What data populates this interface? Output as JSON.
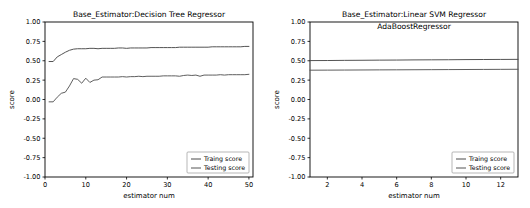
{
  "figure": {
    "background_color": "#ffffff",
    "width": 530,
    "height": 208
  },
  "chart_data": [
    {
      "id": "decision-tree",
      "type": "line",
      "title": "Base_Estimator:Decision Tree Regressor",
      "title_line2": "",
      "xlabel": "estimator num",
      "ylabel": "score",
      "xlim": [
        0,
        51
      ],
      "ylim": [
        -1.0,
        1.0
      ],
      "xticks": [
        0,
        10,
        20,
        30,
        40,
        50
      ],
      "xticklabels": [
        "0",
        "10",
        "20",
        "30",
        "40",
        "50"
      ],
      "yticks": [
        -1.0,
        -0.75,
        -0.5,
        -0.25,
        0.0,
        0.25,
        0.5,
        0.75,
        1.0
      ],
      "yticklabels": [
        "-1.00",
        "-0.75",
        "-0.50",
        "-0.25",
        "0.00",
        "0.25",
        "0.50",
        "0.75",
        "1.00"
      ],
      "grid": false,
      "legend_position": "lower right",
      "x": [
        1,
        2,
        3,
        4,
        5,
        6,
        7,
        8,
        9,
        10,
        11,
        12,
        13,
        14,
        15,
        16,
        17,
        18,
        19,
        20,
        21,
        22,
        23,
        24,
        25,
        26,
        27,
        28,
        29,
        30,
        31,
        32,
        33,
        34,
        35,
        36,
        37,
        38,
        39,
        40,
        41,
        42,
        43,
        44,
        45,
        46,
        47,
        48,
        49,
        50
      ],
      "series": [
        {
          "name": "Traing score",
          "color": "#4a4a4a",
          "values": [
            0.49,
            0.49,
            0.55,
            0.58,
            0.61,
            0.635,
            0.65,
            0.655,
            0.655,
            0.655,
            0.66,
            0.66,
            0.655,
            0.66,
            0.66,
            0.66,
            0.66,
            0.665,
            0.665,
            0.66,
            0.665,
            0.665,
            0.665,
            0.665,
            0.665,
            0.67,
            0.67,
            0.67,
            0.67,
            0.67,
            0.67,
            0.67,
            0.675,
            0.675,
            0.675,
            0.675,
            0.675,
            0.675,
            0.675,
            0.675,
            0.68,
            0.68,
            0.68,
            0.68,
            0.68,
            0.68,
            0.68,
            0.68,
            0.685,
            0.685
          ]
        },
        {
          "name": "Testing score",
          "color": "#555555",
          "values": [
            -0.03,
            -0.03,
            0.03,
            0.08,
            0.095,
            0.175,
            0.27,
            0.26,
            0.21,
            0.275,
            0.22,
            0.25,
            0.255,
            0.29,
            0.29,
            0.29,
            0.29,
            0.29,
            0.295,
            0.29,
            0.295,
            0.295,
            0.3,
            0.295,
            0.3,
            0.3,
            0.3,
            0.3,
            0.305,
            0.305,
            0.305,
            0.305,
            0.3,
            0.31,
            0.315,
            0.31,
            0.315,
            0.3,
            0.315,
            0.315,
            0.315,
            0.315,
            0.32,
            0.315,
            0.32,
            0.32,
            0.32,
            0.32,
            0.32,
            0.325
          ]
        }
      ]
    },
    {
      "id": "linear-svm",
      "type": "line",
      "title": "Base_Estimator:Linear SVM Regressor",
      "title_line2": "AdaBoostRegressor",
      "xlabel": "estimator num",
      "ylabel": "score",
      "xlim": [
        1,
        13
      ],
      "ylim": [
        -1.0,
        1.0
      ],
      "xticks": [
        2,
        4,
        6,
        8,
        10,
        12
      ],
      "xticklabels": [
        "2",
        "4",
        "6",
        "8",
        "10",
        "12"
      ],
      "yticks": [
        -1.0,
        -0.75,
        -0.5,
        -0.25,
        0.0,
        0.25,
        0.5,
        0.75,
        1.0
      ],
      "yticklabels": [
        "-1.00",
        "-0.75",
        "-0.50",
        "-0.25",
        "0.00",
        "0.25",
        "0.50",
        "0.75",
        "1.00"
      ],
      "grid": false,
      "legend_position": "lower right",
      "x": [
        1,
        2,
        3,
        4,
        5,
        6,
        7,
        8,
        9,
        10,
        11,
        12,
        13
      ],
      "series": [
        {
          "name": "Traing score",
          "color": "#4a4a4a",
          "values": [
            0.502,
            0.503,
            0.505,
            0.506,
            0.508,
            0.509,
            0.511,
            0.512,
            0.513,
            0.515,
            0.516,
            0.517,
            0.518
          ]
        },
        {
          "name": "Testing score",
          "color": "#555555",
          "values": [
            0.378,
            0.379,
            0.38,
            0.381,
            0.382,
            0.383,
            0.384,
            0.385,
            0.386,
            0.387,
            0.388,
            0.389,
            0.39
          ]
        }
      ]
    }
  ]
}
